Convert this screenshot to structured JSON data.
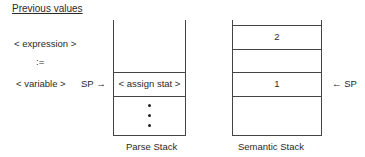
{
  "title": "Previous values",
  "left_labels": {
    "expression": "< expression >",
    "assign_op": ":=",
    "variable": "< variable >"
  },
  "parse_stack": {
    "pointer_label": "SP →",
    "top_cell": "< assign stat >",
    "continuation": "• • •",
    "caption": "Parse Stack"
  },
  "semantic_stack": {
    "cells": [
      "2",
      "",
      "1",
      ""
    ],
    "pointer_label": "← SP",
    "caption": "Semantic Stack"
  }
}
